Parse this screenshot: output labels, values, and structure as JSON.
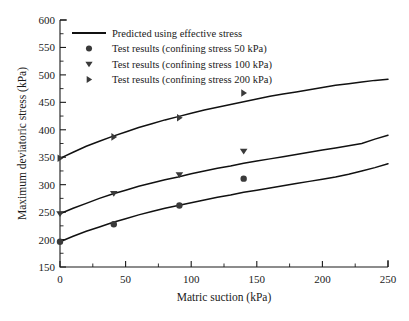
{
  "chart_data": {
    "type": "line",
    "title": "",
    "xlabel": "Matric suction (kPa)",
    "ylabel": "Maximum deviatoric stress (kPa)",
    "xlim": [
      0,
      250
    ],
    "ylim": [
      150,
      600
    ],
    "xticks": [
      0,
      50,
      100,
      150,
      200,
      250
    ],
    "yticks": [
      150,
      200,
      250,
      300,
      350,
      400,
      450,
      500,
      550,
      600
    ],
    "xtick_labels": [
      "0",
      "50",
      "100",
      "150",
      "200",
      "250"
    ],
    "ytick_labels": [
      "150",
      "200",
      "250",
      "300",
      "350",
      "400",
      "450",
      "500",
      "550",
      "600"
    ],
    "x_minor_interval": 25,
    "y_minor_interval": 25,
    "grid": false,
    "legend_position": "upper left",
    "legend": [
      {
        "label": "Predicted using effective stress",
        "marker": "line"
      },
      {
        "label": "Test results (confining stress 50 kPa)",
        "marker": "circle"
      },
      {
        "label": "Test results (confining stress 100 kPa)",
        "marker": "triangle-down"
      },
      {
        "label": "Test results (confining stress 200 kPa)",
        "marker": "triangle-right"
      }
    ],
    "series": [
      {
        "name": "Predicted using effective stress (confining stress 200 kPa)",
        "type": "line",
        "marker": "line",
        "x": [
          0,
          10,
          20,
          30,
          40,
          50,
          60,
          70,
          80,
          90,
          100,
          110,
          120,
          130,
          140,
          150,
          160,
          170,
          180,
          190,
          200,
          210,
          220,
          230,
          240,
          250
        ],
        "y": [
          348,
          359,
          370,
          379,
          388,
          396,
          404,
          411,
          418,
          424,
          430,
          436,
          441,
          446,
          451,
          456,
          461,
          465,
          469,
          473,
          477,
          481,
          484,
          487,
          490,
          492
        ]
      },
      {
        "name": "Predicted using effective stress (confining stress 100 kPa)",
        "type": "line",
        "marker": "line",
        "x": [
          0,
          10,
          20,
          30,
          40,
          50,
          60,
          70,
          80,
          90,
          100,
          110,
          120,
          130,
          140,
          150,
          160,
          170,
          180,
          190,
          200,
          210,
          220,
          230,
          240,
          250
        ],
        "y": [
          247,
          257,
          266,
          275,
          283,
          290,
          297,
          303,
          309,
          314,
          320,
          325,
          330,
          334,
          339,
          343,
          347,
          351,
          355,
          359,
          363,
          367,
          371,
          375,
          383,
          390
        ]
      },
      {
        "name": "Predicted using effective stress (confining stress 50 kPa)",
        "type": "line",
        "marker": "line",
        "x": [
          0,
          10,
          20,
          30,
          40,
          50,
          60,
          70,
          80,
          90,
          100,
          110,
          120,
          130,
          140,
          150,
          160,
          170,
          180,
          190,
          200,
          210,
          220,
          230,
          240,
          250
        ],
        "y": [
          196,
          206,
          215,
          223,
          231,
          238,
          245,
          251,
          257,
          262,
          267,
          272,
          277,
          281,
          286,
          290,
          294,
          298,
          302,
          306,
          310,
          314,
          319,
          325,
          331,
          338
        ]
      },
      {
        "name": "Test results (confining stress 200 kPa)",
        "type": "scatter",
        "marker": "triangle-right",
        "x": [
          0,
          41,
          91,
          140
        ],
        "y": [
          348,
          387,
          422,
          467
        ]
      },
      {
        "name": "Test results (confining stress 100 kPa)",
        "type": "scatter",
        "marker": "triangle-down",
        "x": [
          0,
          41,
          91,
          140
        ],
        "y": [
          247,
          284,
          318,
          361
        ]
      },
      {
        "name": "Test results (confining stress 50 kPa)",
        "type": "scatter",
        "marker": "circle",
        "x": [
          0,
          41,
          91,
          140
        ],
        "y": [
          196,
          228,
          262,
          311
        ]
      }
    ],
    "colors": {
      "curve": "#111111",
      "marker": "#3a3a3a",
      "axis": "#1a1a1a",
      "background": "#ffffff"
    }
  }
}
